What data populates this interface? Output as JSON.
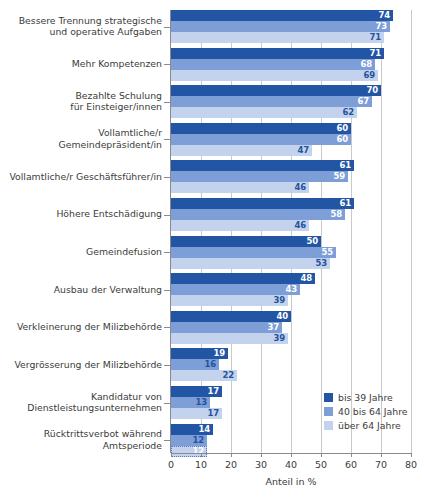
{
  "chart_data": {
    "type": "bar",
    "orientation": "horizontal",
    "title": "",
    "xlabel": "Anteil in %",
    "ylabel": "",
    "xlim": [
      0,
      80
    ],
    "xticks": [
      0,
      10,
      20,
      30,
      40,
      50,
      60,
      70,
      80
    ],
    "grid": true,
    "legend_position": "bottom-right",
    "categories": [
      "Bessere Trennung strategische\nund operative Aufgaben",
      "Mehr Kompetenzen",
      "Bezahlte Schulung\nfür Einsteiger/innen",
      "Vollamtliche/r\nGemeindepräsident/in",
      "Vollamtliche/r Geschäftsführer/in",
      "Höhere Entschädigung",
      "Gemeindefusion",
      "Ausbau der Verwaltung",
      "Verkleinerung der Milizbehörde",
      "Vergrösserung der Milizbehörde",
      "Kandidatur von\nDienstleistungsunternehmen",
      "Rücktrittsverbot während\nAmtsperiode"
    ],
    "series": [
      {
        "name": "bis 39 Jahre",
        "color": "#2255a4",
        "values": [
          74,
          71,
          70,
          60,
          61,
          61,
          50,
          48,
          40,
          19,
          17,
          14
        ]
      },
      {
        "name": "40 bis 64 Jahre",
        "color": "#7d9ed6",
        "values": [
          73,
          68,
          67,
          60,
          59,
          58,
          55,
          43,
          37,
          16,
          13,
          12
        ]
      },
      {
        "name": "über 64 Jahre",
        "color": "#c3d3ee",
        "values": [
          71,
          69,
          62,
          47,
          46,
          46,
          53,
          39,
          39,
          22,
          17,
          12
        ]
      }
    ]
  },
  "legend": {
    "items": [
      {
        "label": "bis 39 Jahre"
      },
      {
        "label": "40 bis 64 Jahre"
      },
      {
        "label": "über 64 Jahre"
      }
    ]
  },
  "axis": {
    "x_title": "Anteil in %",
    "x_tick_labels": [
      "0",
      "10",
      "20",
      "30",
      "40",
      "50",
      "60",
      "70",
      "80"
    ]
  }
}
